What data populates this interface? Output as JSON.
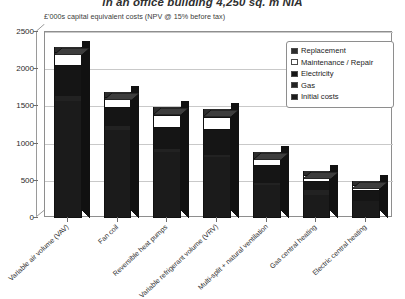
{
  "chart_data": {
    "type": "bar",
    "subtype": "stacked-3d-column",
    "title": "in an office building 4,250 sq. m NIA",
    "subtitle": "£'000s capital equivalent costs (NPV @ 15% before tax)",
    "xlabel": "",
    "ylabel": "",
    "ylim": [
      0,
      2500
    ],
    "ytick_labels": [
      "0",
      "500",
      "1000",
      "1500",
      "2000",
      "2500"
    ],
    "ytick_values": [
      0,
      500,
      1000,
      1500,
      2000,
      2500
    ],
    "grid": true,
    "legend_position": "top-right",
    "categories": [
      "Variable air volume (VAV)",
      "Fan coil",
      "Reversible heat pumps",
      "Variable refrigerant volume (VRV)",
      "Multi-split + natural ventilation",
      "Gas central heating",
      "Electric central heating"
    ],
    "series": [
      {
        "name": "Initial costs",
        "color": "#1b1b1b",
        "values": [
          1560,
          1170,
          870,
          800,
          430,
          300,
          210
        ]
      },
      {
        "name": "Gas",
        "color": "#222222",
        "values": [
          60,
          50,
          40,
          40,
          30,
          60,
          0
        ]
      },
      {
        "name": "Electricity",
        "color": "#151515",
        "values": [
          410,
          240,
          290,
          330,
          220,
          110,
          140
        ]
      },
      {
        "name": "Maintenance / Repair",
        "color": "#ffffff",
        "values": [
          190,
          160,
          170,
          170,
          120,
          90,
          80
        ]
      },
      {
        "name": "Replacement",
        "color": "#2c2c2c",
        "values": [
          60,
          60,
          110,
          110,
          80,
          60,
          50
        ]
      }
    ],
    "totals": [
      2280,
      1680,
      1480,
      1450,
      880,
      620,
      480
    ]
  },
  "legend": {
    "items": [
      {
        "label": "Replacement",
        "swatch": "#2c2c2c"
      },
      {
        "label": "Maintenance / Repair",
        "swatch": "#ffffff"
      },
      {
        "label": "Electricity",
        "swatch": "#151515"
      },
      {
        "label": "Gas",
        "swatch": "#222222"
      },
      {
        "label": "Initial costs",
        "swatch": "#1b1b1b"
      }
    ]
  }
}
